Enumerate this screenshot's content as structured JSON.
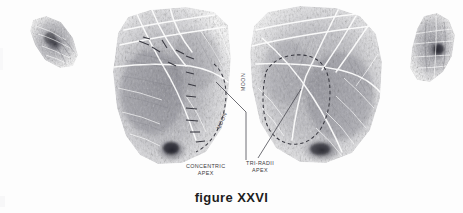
{
  "figure": {
    "caption": "figure XXVI",
    "plate_kind": "palm-print-plate",
    "background_color": "#fdfdfd",
    "ink_color": "#4a4a52",
    "annotation_color": "#3a3a40",
    "width": 463,
    "height": 213
  },
  "annotations": {
    "concentric_apex": {
      "line1": "CONCENTRIC",
      "line2": "APEX"
    },
    "tri_radii_apex": {
      "line1": "TRI-RADII",
      "line2": "APEX"
    },
    "moon_left": "MOON",
    "moon_right": "MOON"
  },
  "prints": [
    {
      "name": "left-thumb-print",
      "label": "left thumb print"
    },
    {
      "name": "left-palm-print",
      "label": "left palm print"
    },
    {
      "name": "right-palm-print",
      "label": "right palm print"
    },
    {
      "name": "right-thumb-print",
      "label": "right thumb print"
    }
  ]
}
